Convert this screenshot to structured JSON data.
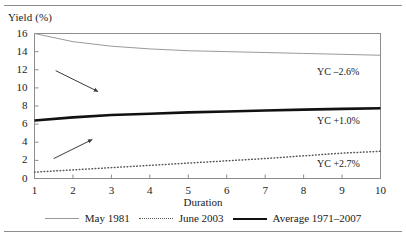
{
  "chart_data": {
    "type": "line",
    "title": "",
    "xlabel": "Duration",
    "ylabel": "Yield (%)",
    "xlim": [
      1,
      10
    ],
    "ylim": [
      0,
      16
    ],
    "xticks": [
      "1",
      "2",
      "3",
      "4",
      "5",
      "6",
      "7",
      "8",
      "9",
      "10"
    ],
    "yticks": [
      "0",
      "2",
      "4",
      "6",
      "8",
      "10",
      "12",
      "14",
      "16"
    ],
    "grid": false,
    "legend_position": "bottom",
    "x": [
      1,
      2,
      3,
      4,
      5,
      6,
      7,
      8,
      9,
      10
    ],
    "series": [
      {
        "name": "May 1981",
        "style": "solid-thin",
        "color": "#9a9a9a",
        "values": [
          16.0,
          15.1,
          14.6,
          14.3,
          14.1,
          14.0,
          13.9,
          13.8,
          13.7,
          13.6
        ]
      },
      {
        "name": "June 2003",
        "style": "dotted",
        "color": "#555555",
        "values": [
          0.7,
          0.95,
          1.2,
          1.45,
          1.7,
          1.95,
          2.2,
          2.5,
          2.8,
          3.0
        ]
      },
      {
        "name": "Average 1971–2007",
        "style": "solid-thick",
        "color": "#111111",
        "values": [
          6.4,
          6.75,
          7.0,
          7.15,
          7.3,
          7.4,
          7.5,
          7.6,
          7.68,
          7.75
        ]
      }
    ],
    "annotations": [
      {
        "id": "yc-may-1981",
        "text": "YC –2.6%",
        "x": 9.0,
        "y": 11.6
      },
      {
        "id": "yc-average",
        "text": "YC +1.0%",
        "x": 9.0,
        "y": 6.2
      },
      {
        "id": "yc-june-2003",
        "text": "YC +2.7%",
        "x": 9.0,
        "y": 1.5
      }
    ],
    "arrows": [
      {
        "id": "arrow-to-may-1981",
        "x1": 1.55,
        "y1": 11.9,
        "x2": 2.65,
        "y2": 9.6
      },
      {
        "id": "arrow-to-june-2003",
        "x1": 1.5,
        "y1": 2.2,
        "x2": 2.5,
        "y2": 4.3
      }
    ]
  },
  "legend": {
    "items": [
      {
        "label": "May 1981",
        "swatch": "solid-thin"
      },
      {
        "label": "June 2003",
        "swatch": "dotted"
      },
      {
        "label": "Average 1971–2007",
        "swatch": "solid-thick"
      }
    ]
  }
}
